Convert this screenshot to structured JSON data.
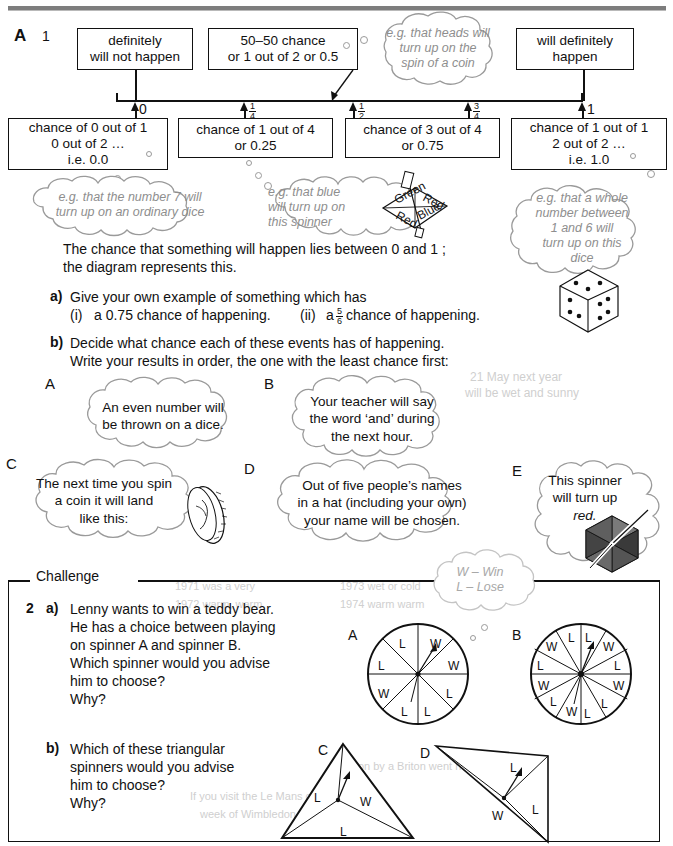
{
  "page": {
    "section_letter": "A",
    "question_number": "1"
  },
  "scale_boxes": {
    "top": [
      {
        "name": "definitely-will-not-happen",
        "lines": [
          "definitely",
          "will not happen"
        ]
      },
      {
        "name": "fifty-fifty-chance",
        "lines": [
          "50–50 chance",
          "or 1 out of 2 or 0.5"
        ]
      },
      {
        "name": "will-definitely-happen",
        "lines": [
          "will definitely",
          "happen"
        ]
      }
    ],
    "bottom": [
      {
        "name": "chance-0-out-of-1",
        "lines": [
          "chance of 0 out of 1",
          "0 out of 2 …",
          "i.e. 0.0"
        ]
      },
      {
        "name": "chance-1-out-of-4",
        "lines": [
          "chance of 1 out of 4",
          "or 0.25"
        ]
      },
      {
        "name": "chance-3-out-of-4",
        "lines": [
          "chance of 3 out of 4",
          "or 0.75"
        ]
      },
      {
        "name": "chance-1-out-of-1",
        "lines": [
          "chance of 1 out of 1",
          "2 out of 2 …",
          "i.e. 1.0"
        ]
      }
    ]
  },
  "number_line": {
    "ticks": [
      {
        "label": "0",
        "type": "plain"
      },
      {
        "label": "1/4",
        "type": "fraction",
        "num": "1",
        "den": "4"
      },
      {
        "label": "1/2",
        "type": "fraction",
        "num": "1",
        "den": "2"
      },
      {
        "label": "3/4",
        "type": "fraction",
        "num": "3",
        "den": "4"
      },
      {
        "label": "1",
        "type": "plain"
      }
    ]
  },
  "example_clouds": {
    "coin": [
      "e.g. that heads will",
      "turn up on the",
      "spin of a coin"
    ],
    "dice7": [
      "e.g. that the number 7 will",
      "turn up on an ordinary dice"
    ],
    "blue_spinner": [
      "e.g. that blue",
      "will turn up on",
      "this spinner"
    ],
    "blue_spinner_labels": [
      "Red",
      "Blue",
      "Green",
      "Red"
    ],
    "whole_number": [
      "e.g. that a whole",
      "number between",
      "1 and 6 will",
      "turn up on this",
      "dice"
    ]
  },
  "body": {
    "intro": [
      "The chance that something will happen lies between 0 and 1 ;",
      "the diagram represents this."
    ],
    "part_a_label": "a)",
    "part_a_text": "Give your own example of something which has",
    "part_a_i_label": "(i)",
    "part_a_i_text": "a 0.75 chance of happening.",
    "part_a_ii_label": "(ii)",
    "part_a_ii_text_before": "a",
    "part_a_ii_frac_num": "5",
    "part_a_ii_frac_den": "6",
    "part_a_ii_text_after": "chance of happening.",
    "part_b_label": "b)",
    "part_b_text": [
      "Decide what chance each of these events has of happening.",
      "Write your results in order, the one with the least chance first:"
    ]
  },
  "event_clouds": [
    {
      "letter": "A",
      "lines": [
        "An even number will",
        "be thrown on a dice."
      ]
    },
    {
      "letter": "B",
      "lines": [
        "Your teacher will say",
        "the word ‘and’ during",
        "the next hour."
      ]
    },
    {
      "letter": "C",
      "lines": [
        "The next time you spin",
        "a coin it will land",
        "like this:"
      ],
      "icon": "coin-icon"
    },
    {
      "letter": "D",
      "lines": [
        "Out of five people’s names",
        "in a hat (including your own)",
        "your name will be chosen."
      ]
    },
    {
      "letter": "E",
      "lines": [
        "This spinner",
        "will turn up",
        "red."
      ],
      "icon": "hex-spinner-icon"
    }
  ],
  "challenge": {
    "label": "Challenge",
    "number": "2",
    "key_cloud": [
      "W – Win",
      "L – Lose"
    ],
    "part_a_label": "a)",
    "part_a_lines": [
      "Lenny wants to win a teddy bear.",
      "He has a choice between playing",
      "on spinner A and spinner B.",
      "Which spinner would you advise",
      "him to choose?",
      "Why?"
    ],
    "part_b_label": "b)",
    "part_b_lines": [
      "Which of these triangular",
      "spinners would you advise",
      "him to choose?",
      "Why?"
    ],
    "spinners": [
      {
        "name": "spinner-a",
        "letter": "A",
        "segments": [
          "W",
          "W",
          "L",
          "L",
          "L",
          "W",
          "L",
          "L"
        ]
      },
      {
        "name": "spinner-b",
        "letter": "B",
        "segments": [
          "L",
          "W",
          "L",
          "W",
          "L",
          "L",
          "W",
          "L",
          "W",
          "L",
          "W",
          "L"
        ]
      },
      {
        "name": "spinner-c",
        "letter": "C",
        "segments": [
          "L",
          "W",
          "L"
        ]
      },
      {
        "name": "spinner-d",
        "letter": "D",
        "segments": [
          "L",
          "W",
          "L"
        ]
      }
    ]
  },
  "ghost_text": {
    "items": [
      "21 May next year",
      "will be wet and sunny",
      "1971 was a very",
      "1972 warm, warm",
      "1973 wet or cold",
      "1974 warm warm",
      "If you visit the Le Mans can only will be",
      "week of Wimbledon next year",
      "won by a Briton went next year."
    ]
  },
  "colors": {
    "ink": "#111111",
    "cloud_line": "#9a9a9a",
    "cloud_text": "#8e8e8e",
    "rule": "#7d7d7d",
    "ghost": "#cfcfcf"
  }
}
